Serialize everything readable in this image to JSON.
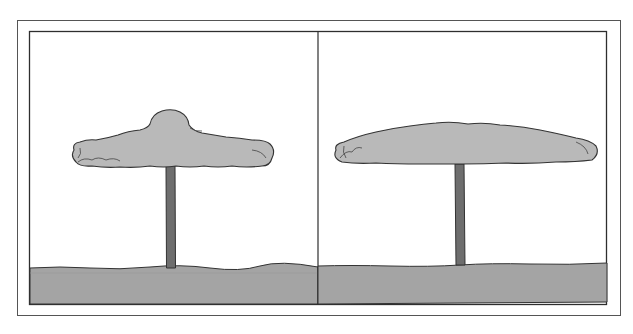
{
  "figure": {
    "colors": {
      "background": "#ffffff",
      "frame": "#3a3a3a",
      "cloud_fill": "#b9b9b9",
      "cloud_stroke": "#3c3c3c",
      "stem_fill": "#6e6e6e",
      "ground_fill": "#a4a4a4",
      "ground_stroke": "#3c3c3c"
    },
    "panels": [
      {
        "id": "left",
        "label": "",
        "cloud": "tall-domed cap",
        "stem": "column"
      },
      {
        "id": "right",
        "label": "",
        "cloud": "wide-flattened cap",
        "stem": "column"
      }
    ]
  }
}
